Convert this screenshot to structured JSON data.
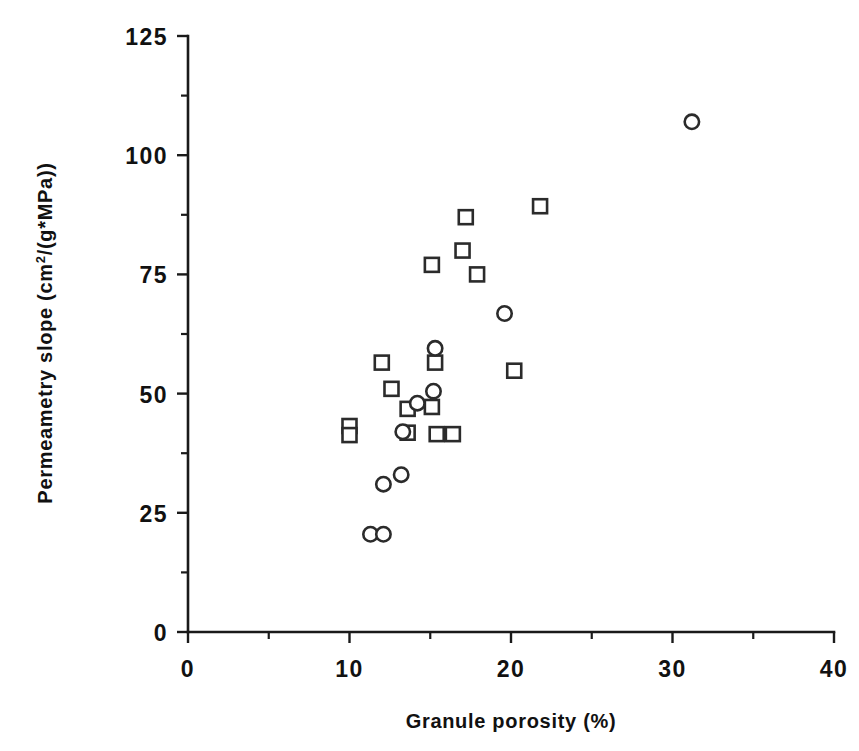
{
  "chart_data": {
    "type": "scatter",
    "title": "",
    "xlabel": "Granule porosity (%)",
    "ylabel": "Permeametry slope  (cm2/(g*MPa))",
    "ylabel_parts": {
      "pre": "Permeametry slope  (cm",
      "sup": "2",
      "post": "/(g*MPa))"
    },
    "xlim": [
      0,
      40
    ],
    "ylim": [
      0,
      125
    ],
    "xticks": [
      0,
      10,
      20,
      30,
      40
    ],
    "xticklabels": [
      "0",
      "10",
      "20",
      "30",
      "40"
    ],
    "xminor_ticks": [
      5,
      15,
      25,
      35
    ],
    "yticks": [
      0,
      25,
      50,
      75,
      100,
      125
    ],
    "yticklabels": [
      "0",
      "25",
      "50",
      "75",
      "100",
      "125"
    ],
    "yminor_ticks": [
      12.5,
      37.5,
      62.5,
      87.5,
      112.5
    ],
    "grid": false,
    "legend": "none",
    "series": [
      {
        "name": "squares",
        "marker": "square",
        "points": [
          {
            "x": 10.0,
            "y": 43.2
          },
          {
            "x": 10.0,
            "y": 41.3
          },
          {
            "x": 12.0,
            "y": 56.5
          },
          {
            "x": 12.6,
            "y": 51.0
          },
          {
            "x": 13.6,
            "y": 46.8
          },
          {
            "x": 13.6,
            "y": 41.8
          },
          {
            "x": 15.1,
            "y": 47.2
          },
          {
            "x": 15.3,
            "y": 56.5
          },
          {
            "x": 15.4,
            "y": 41.5
          },
          {
            "x": 16.4,
            "y": 41.5
          },
          {
            "x": 15.1,
            "y": 77.0
          },
          {
            "x": 17.0,
            "y": 80.0
          },
          {
            "x": 17.2,
            "y": 87.0
          },
          {
            "x": 17.9,
            "y": 75.0
          },
          {
            "x": 20.2,
            "y": 54.8
          },
          {
            "x": 21.8,
            "y": 89.3
          }
        ]
      },
      {
        "name": "circles",
        "marker": "circle",
        "points": [
          {
            "x": 11.3,
            "y": 20.5
          },
          {
            "x": 12.1,
            "y": 20.5
          },
          {
            "x": 12.1,
            "y": 31.0
          },
          {
            "x": 13.2,
            "y": 33.0
          },
          {
            "x": 13.3,
            "y": 42.0
          },
          {
            "x": 14.2,
            "y": 48.0
          },
          {
            "x": 15.2,
            "y": 50.5
          },
          {
            "x": 15.3,
            "y": 59.5
          },
          {
            "x": 19.6,
            "y": 66.8
          },
          {
            "x": 31.2,
            "y": 107.0
          }
        ]
      }
    ]
  },
  "geometry": {
    "plot_left": 188,
    "plot_bottom": 632,
    "plot_right": 834,
    "plot_top": 36
  }
}
